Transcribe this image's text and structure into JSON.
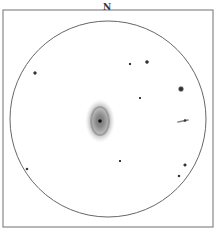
{
  "sketch": {
    "orientation_label": "N",
    "frame": {
      "x": 3,
      "y": 10,
      "width": 210,
      "height": 217,
      "stroke": "#888888"
    },
    "field": {
      "cx": 108,
      "cy": 119,
      "r": 98,
      "stroke": "#555555"
    },
    "galaxy": {
      "cx": 100,
      "cy": 121,
      "rx": 14,
      "ry": 21,
      "core_x": 100,
      "core_y": 121
    },
    "stars": [
      {
        "x": 35,
        "y": 73,
        "r": 2.0
      },
      {
        "x": 130,
        "y": 64,
        "r": 1.5
      },
      {
        "x": 147,
        "y": 62,
        "r": 2.0
      },
      {
        "x": 140,
        "y": 98,
        "r": 1.3
      },
      {
        "x": 181,
        "y": 89,
        "r": 3.0
      },
      {
        "x": 120,
        "y": 161,
        "r": 1.5
      },
      {
        "x": 185,
        "y": 165,
        "r": 2.0
      },
      {
        "x": 179,
        "y": 176,
        "r": 1.7
      },
      {
        "x": 27,
        "y": 169,
        "r": 1.7
      }
    ],
    "streak": {
      "x1": 178,
      "y1": 122,
      "x2": 188,
      "y2": 120
    }
  }
}
